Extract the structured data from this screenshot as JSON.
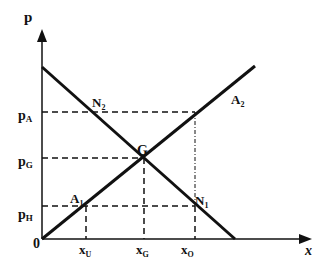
{
  "diagram": {
    "type": "supply-demand",
    "axes": {
      "y_label": "p",
      "x_label": "x",
      "origin_label": "0"
    },
    "price_labels": {
      "pA": "p",
      "pA_sub": "A",
      "pG": "p",
      "pG_sub": "G",
      "pH": "p",
      "pH_sub": "H"
    },
    "quantity_labels": {
      "xU": "x",
      "xU_sub": "U",
      "xG": "x",
      "xG_sub": "G",
      "xO": "x",
      "xO_sub": "O"
    },
    "points": {
      "N2": "N",
      "N2_sub": "2",
      "A2": "A",
      "A2_sub": "2",
      "G": "G",
      "A1": "A",
      "A1_sub": "1",
      "N1": "N",
      "N1_sub": "1"
    },
    "colors": {
      "line": "#111111",
      "background": "#ffffff"
    }
  }
}
